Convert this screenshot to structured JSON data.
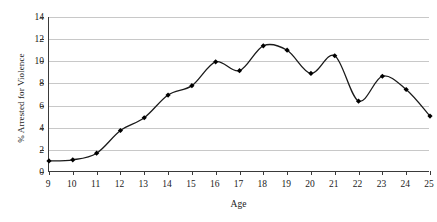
{
  "chart_data": {
    "type": "line",
    "title": "",
    "xlabel": "Age",
    "ylabel": "% Arrested for Violence",
    "x": [
      9,
      10,
      11,
      12,
      13,
      14,
      15,
      16,
      17,
      18,
      19,
      20,
      21,
      22,
      23,
      24,
      25
    ],
    "values": [
      1.0,
      1.1,
      1.7,
      3.75,
      4.9,
      6.95,
      7.8,
      9.95,
      9.15,
      11.4,
      11.0,
      8.9,
      10.5,
      6.4,
      8.65,
      7.45,
      5.05
    ],
    "series": [
      {
        "name": "% Arrested for Violence",
        "values": [
          1.0,
          1.1,
          1.7,
          3.75,
          4.9,
          6.95,
          7.8,
          9.95,
          9.15,
          11.4,
          11.0,
          8.9,
          10.5,
          6.4,
          8.65,
          7.45,
          5.05
        ]
      }
    ],
    "xlim": [
      9,
      25
    ],
    "ylim": [
      0,
      14
    ],
    "x_tick_labels": [
      "9",
      "10",
      "11",
      "12",
      "13",
      "14",
      "15",
      "16",
      "17",
      "18",
      "19",
      "20",
      "21",
      "22",
      "23",
      "24",
      "25"
    ],
    "y_tick_labels": [
      "0",
      "2",
      "4",
      "6",
      "8",
      "10",
      "12",
      "14"
    ],
    "y_ticks": [
      0,
      2,
      4,
      6,
      8,
      10,
      12,
      14
    ],
    "grid": "horizontal",
    "legend": "none",
    "line_color": "#1a1a1a",
    "marker": "diamond",
    "marker_color": "#000000",
    "gridline_color": "#c8c8c8",
    "axis_color": "#3a3a3a",
    "background": "#ffffff",
    "smoothing": "spline"
  }
}
